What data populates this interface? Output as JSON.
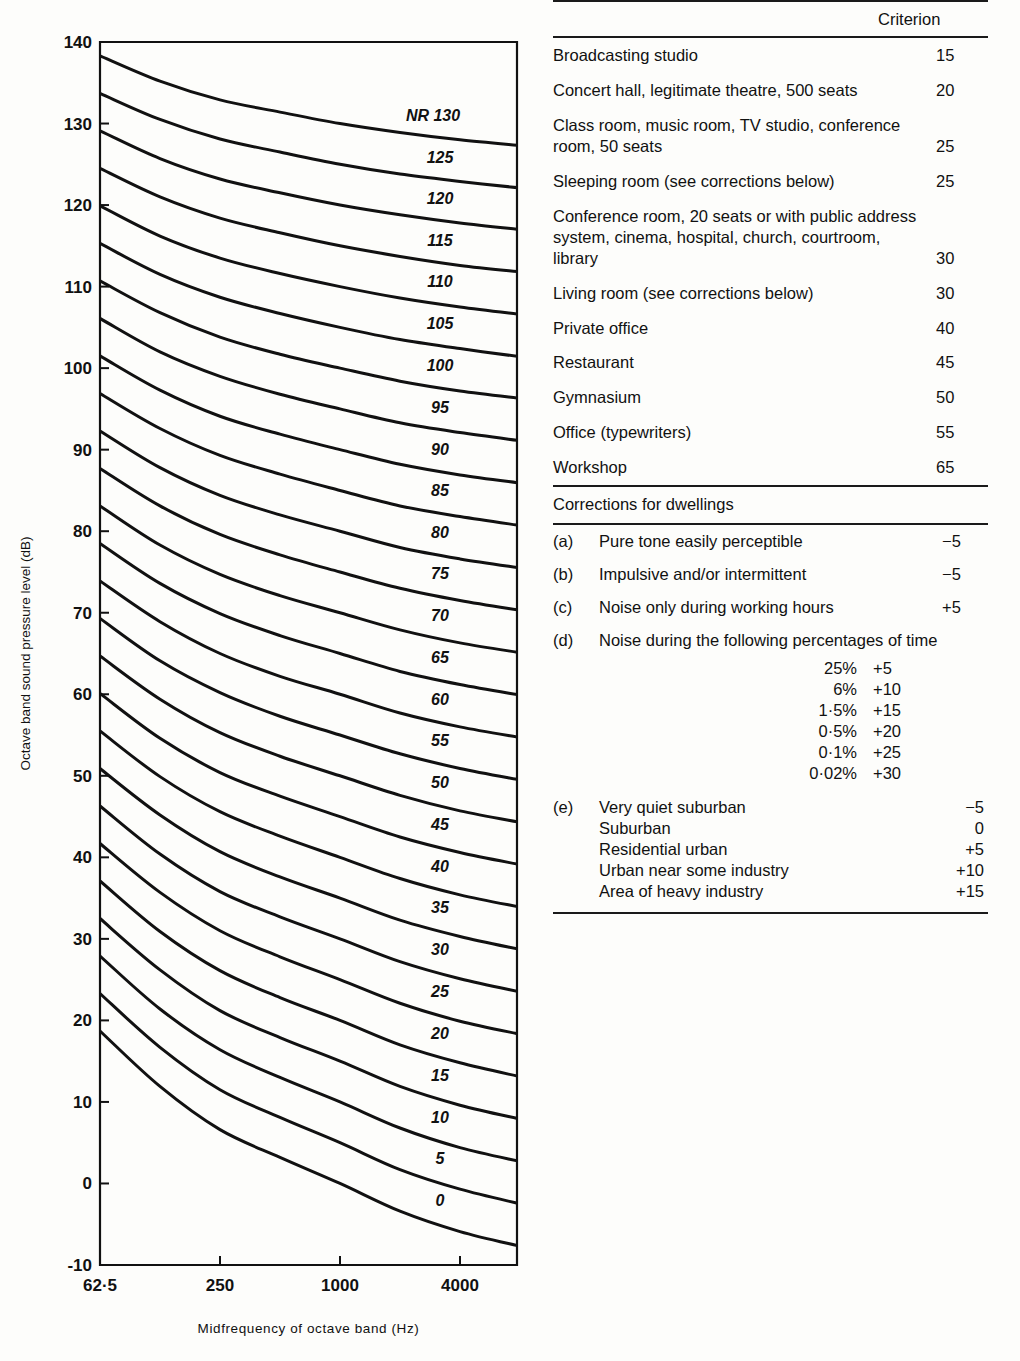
{
  "chart_data": {
    "type": "line",
    "title": "",
    "xlabel": "Midfrequency of octave band (Hz)",
    "ylabel": "Octave band sound pressure level (dB)",
    "xtick_labels": [
      "62·5",
      "250",
      "1000",
      "4000"
    ],
    "xtick_values": [
      62.5,
      250,
      1000,
      4000
    ],
    "ytick_labels": [
      "-10",
      "0",
      "10",
      "20",
      "30",
      "40",
      "50",
      "60",
      "70",
      "80",
      "90",
      "100",
      "110",
      "120",
      "130",
      "140"
    ],
    "ylim": [
      -10,
      140
    ],
    "xlim_octave_index": [
      0,
      7
    ],
    "grid": false,
    "legend": "inline curve labels",
    "octave_bands_hz": [
      31.5,
      63,
      125,
      250,
      500,
      1000,
      2000,
      4000,
      8000
    ],
    "series_label_prefix": "NR",
    "first_label_text": "NR 130",
    "curve_labels": [
      "NR 130",
      "125",
      "120",
      "115",
      "110",
      "105",
      "100",
      "95",
      "90",
      "85",
      "80",
      "75",
      "70",
      "65",
      "60",
      "55",
      "50",
      "45",
      "40",
      "35",
      "30",
      "25",
      "20",
      "15",
      "10",
      "5",
      "0"
    ],
    "series": [
      {
        "name": "NR 130",
        "values": [
          141.5,
          138.3,
          135.2,
          132.9,
          131.4,
          130.0,
          128.9,
          128.0,
          127.3
        ]
      },
      {
        "name": "NR 125",
        "values": [
          137.1,
          133.7,
          130.5,
          128.1,
          126.5,
          125.0,
          123.8,
          122.9,
          122.1
        ]
      },
      {
        "name": "NR 120",
        "values": [
          132.6,
          129.1,
          125.7,
          123.2,
          121.5,
          120.0,
          118.8,
          117.8,
          117.0
        ]
      },
      {
        "name": "NR 115",
        "values": [
          128.2,
          124.5,
          121.0,
          118.4,
          116.6,
          115.0,
          113.7,
          112.6,
          111.8
        ]
      },
      {
        "name": "NR 110",
        "values": [
          123.7,
          119.9,
          116.2,
          113.5,
          111.6,
          110.0,
          108.6,
          107.5,
          106.6
        ]
      },
      {
        "name": "NR 105",
        "values": [
          119.3,
          115.3,
          111.5,
          108.7,
          106.7,
          105.0,
          103.5,
          102.4,
          101.4
        ]
      },
      {
        "name": "NR 100",
        "values": [
          114.8,
          110.7,
          106.8,
          103.8,
          101.7,
          100.0,
          98.4,
          97.2,
          96.3
        ]
      },
      {
        "name": "NR 95",
        "values": [
          110.4,
          106.1,
          102.0,
          99.0,
          96.8,
          95.0,
          93.3,
          92.1,
          91.1
        ]
      },
      {
        "name": "NR 90",
        "values": [
          105.9,
          101.5,
          97.3,
          94.1,
          91.9,
          90.0,
          88.2,
          86.9,
          85.9
        ]
      },
      {
        "name": "NR 85",
        "values": [
          101.5,
          96.9,
          92.6,
          89.3,
          87.0,
          85.0,
          83.1,
          81.8,
          80.7
        ]
      },
      {
        "name": "NR 80",
        "values": [
          97.0,
          92.3,
          87.8,
          84.4,
          82.0,
          80.0,
          78.0,
          76.6,
          75.5
        ]
      },
      {
        "name": "NR 75",
        "values": [
          92.6,
          87.7,
          83.1,
          79.6,
          77.1,
          75.0,
          73.0,
          71.5,
          70.3
        ]
      },
      {
        "name": "NR 70",
        "values": [
          88.1,
          83.1,
          78.3,
          74.7,
          72.1,
          70.0,
          67.9,
          66.3,
          65.1
        ]
      },
      {
        "name": "NR 65",
        "values": [
          83.7,
          78.5,
          73.6,
          69.9,
          67.2,
          65.0,
          62.8,
          61.2,
          59.9
        ]
      },
      {
        "name": "NR 60",
        "values": [
          79.2,
          73.9,
          68.9,
          65.0,
          62.2,
          60.0,
          57.7,
          56.0,
          54.7
        ]
      },
      {
        "name": "NR 55",
        "values": [
          74.8,
          69.3,
          64.1,
          60.2,
          57.3,
          55.0,
          52.7,
          50.9,
          49.5
        ]
      },
      {
        "name": "NR 50",
        "values": [
          70.3,
          64.7,
          59.4,
          55.3,
          52.4,
          50.0,
          47.6,
          45.7,
          44.3
        ]
      },
      {
        "name": "NR 45",
        "values": [
          65.9,
          60.1,
          54.6,
          50.4,
          47.5,
          45.0,
          42.5,
          40.6,
          39.1
        ]
      },
      {
        "name": "NR 40",
        "values": [
          61.4,
          55.5,
          49.9,
          45.6,
          42.6,
          40.0,
          37.4,
          35.4,
          33.9
        ]
      },
      {
        "name": "NR 35",
        "values": [
          57.0,
          50.9,
          45.2,
          40.7,
          37.6,
          35.0,
          32.3,
          30.3,
          28.7
        ]
      },
      {
        "name": "NR 30",
        "values": [
          52.5,
          46.3,
          40.4,
          35.8,
          32.7,
          30.0,
          27.2,
          25.1,
          23.5
        ]
      },
      {
        "name": "NR 25",
        "values": [
          48.1,
          41.7,
          35.7,
          31.0,
          27.8,
          25.0,
          22.1,
          19.9,
          18.3
        ]
      },
      {
        "name": "NR 20",
        "values": [
          43.6,
          37.1,
          30.9,
          26.1,
          22.8,
          20.0,
          17.0,
          14.8,
          13.1
        ]
      },
      {
        "name": "NR 15",
        "values": [
          39.2,
          32.5,
          26.2,
          21.2,
          17.9,
          15.0,
          11.9,
          9.6,
          7.9
        ]
      },
      {
        "name": "NR 10",
        "values": [
          34.7,
          27.9,
          21.4,
          16.4,
          13.0,
          10.0,
          6.8,
          4.4,
          2.7
        ]
      },
      {
        "name": "NR 5",
        "values": [
          30.3,
          23.3,
          16.7,
          11.5,
          8.1,
          5.0,
          1.7,
          -0.7,
          -2.5
        ]
      },
      {
        "name": "NR 0",
        "values": [
          25.8,
          18.7,
          11.9,
          6.6,
          3.2,
          0.0,
          -3.4,
          -5.9,
          -7.7
        ]
      }
    ]
  },
  "table": {
    "header": {
      "criterion_label": "Criterion"
    },
    "criteria_rows": [
      {
        "desc": "Broadcasting studio",
        "value": "15"
      },
      {
        "desc": "Concert hall, legitimate theatre, 500 seats",
        "value": "20"
      },
      {
        "desc": "Class room, music room, TV studio, conference room, 50 seats",
        "value": "25"
      },
      {
        "desc": "Sleeping room (see corrections below)",
        "value": "25"
      },
      {
        "desc": "Conference room, 20 seats or with public address system, cinema, hospital, church, courtroom, library",
        "value": "30"
      },
      {
        "desc": "Living room (see corrections below)",
        "value": "30"
      },
      {
        "desc": "Private office",
        "value": "40"
      },
      {
        "desc": "Restaurant",
        "value": "45"
      },
      {
        "desc": "Gymnasium",
        "value": "50"
      },
      {
        "desc": "Office (typewriters)",
        "value": "55"
      },
      {
        "desc": "Workshop",
        "value": "65"
      }
    ],
    "corrections_title": "Corrections for dwellings",
    "corrections": [
      {
        "tag": "(a)",
        "text": "Pure tone easily perceptible",
        "value": "−5"
      },
      {
        "tag": "(b)",
        "text": "Impulsive and/or intermittent",
        "value": "−5"
      },
      {
        "tag": "(c)",
        "text": "Noise only during working hours",
        "value": "+5"
      },
      {
        "tag": "(d)",
        "text": "Noise during the following percentages of time",
        "value": ""
      }
    ],
    "percentages": [
      {
        "label": "25%",
        "value": "+5"
      },
      {
        "label": "6%",
        "value": "+10"
      },
      {
        "label": "1·5%",
        "value": "+15"
      },
      {
        "label": "0·5%",
        "value": "+20"
      },
      {
        "label": "0·1%",
        "value": "+25"
      },
      {
        "label": "0·02%",
        "value": "+30"
      }
    ],
    "environment": {
      "tag": "(e)",
      "rows": [
        {
          "name": "Very quiet suburban",
          "value": "−5"
        },
        {
          "name": "Suburban",
          "value": "0"
        },
        {
          "name": "Residential urban",
          "value": "+5"
        },
        {
          "name": "Urban near some industry",
          "value": "+10"
        },
        {
          "name": "Area of heavy industry",
          "value": "+15"
        }
      ]
    }
  },
  "colors": {
    "ink": "#111111",
    "paper": "#fdfdfb",
    "rule": "#1a1a1a"
  }
}
